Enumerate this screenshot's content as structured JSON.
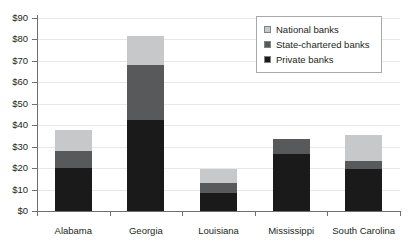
{
  "chart_data": {
    "type": "bar",
    "subtype": "stacked-bar-vertical",
    "title": "",
    "subtitle": "",
    "xlabel": "",
    "ylabel": "",
    "categories": [
      "Alabama",
      "Georgia",
      "Louisiana",
      "Mississippi",
      "South Carolina"
    ],
    "series": [
      {
        "name": "Private banks",
        "color": "#1a1a1a",
        "values": [
          20,
          42.5,
          8.5,
          26.5,
          19.5
        ]
      },
      {
        "name": "State-chartered banks",
        "color": "#58595b",
        "values": [
          8,
          25.5,
          4.5,
          7,
          4
        ]
      },
      {
        "name": "National banks",
        "color": "#c7c8ca",
        "values": [
          10,
          13.5,
          6.5,
          0,
          12
        ]
      }
    ],
    "totals": [
      38,
      81.5,
      19.5,
      33.5,
      35.5
    ],
    "ylim": [
      0,
      90
    ],
    "ytick_values": [
      0,
      10,
      20,
      30,
      40,
      50,
      60,
      70,
      80,
      90
    ],
    "ytick_labels": [
      "$0",
      "$10",
      "$20",
      "$30",
      "$40",
      "$50",
      "$60",
      "$70",
      "$80",
      "$90"
    ],
    "grid": true,
    "grid_axis": "y",
    "legend_position": "top-right",
    "legend_entries": [
      "National banks",
      "State-chartered banks",
      "Private banks"
    ]
  },
  "legend": {
    "items": [
      {
        "label": "National banks",
        "color": "#c7c8ca"
      },
      {
        "label": "State-chartered banks",
        "color": "#58595b"
      },
      {
        "label": "Private banks",
        "color": "#1a1a1a"
      }
    ]
  },
  "colors": {
    "private_banks": "#1a1a1a",
    "state_chartered_banks": "#58595b",
    "national_banks": "#c7c8ca",
    "axis": "#6d6e71",
    "gridline": "#e8e8e8",
    "text": "#231f20",
    "background": "#ffffff"
  }
}
